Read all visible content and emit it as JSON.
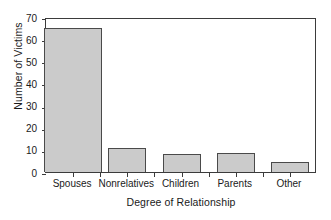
{
  "chart_data": {
    "type": "bar",
    "title": "",
    "xlabel": "Degree of Relationship",
    "ylabel": "Number of Victims",
    "categories": [
      "Spouses",
      "Nonrelatives",
      "Children",
      "Parents",
      "Other"
    ],
    "values": [
      65,
      11,
      8,
      8.5,
      4.5
    ],
    "ylim": [
      0,
      70
    ],
    "ytick_labels": [
      "0",
      "10",
      "20",
      "30",
      "40",
      "50",
      "60",
      "70"
    ],
    "ytick_values": [
      0,
      10,
      20,
      30,
      40,
      50,
      60,
      70
    ],
    "grid": false,
    "legend": null,
    "bar_fill_color": "#cbcbcb",
    "bar_edge_color": "#4a4a4a",
    "axis_color": "#3b3b3b",
    "background_color": "#ffffff"
  }
}
